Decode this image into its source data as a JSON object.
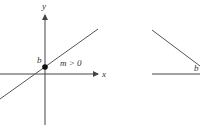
{
  "diagram": {
    "left_panel": {
      "y_axis_label": "y",
      "x_axis_label": "x",
      "intercept_label": "b",
      "slope_label": "m > 0"
    },
    "right_panel": {
      "intercept_label": "b"
    },
    "colors": {
      "line": "#555555",
      "axis": "#444444",
      "point": "#111111",
      "background": "#ffffff"
    }
  }
}
